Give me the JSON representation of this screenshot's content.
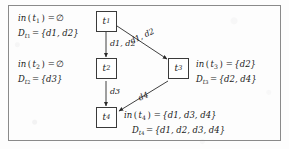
{
  "figure": {
    "type": "dataflow-graph",
    "border_color": "#8a8a8a",
    "node_border_color": "#3a3a3a",
    "edge_color": "#2a2a2a",
    "background": "#fdfdfd"
  },
  "nodes": [
    {
      "id": "t1",
      "base": "t",
      "sub": "1",
      "label": "t1"
    },
    {
      "id": "t2",
      "base": "t",
      "sub": "2",
      "label": "t2"
    },
    {
      "id": "t3",
      "base": "t",
      "sub": "3",
      "label": "t3"
    },
    {
      "id": "t4",
      "base": "t",
      "sub": "4",
      "label": "t4"
    }
  ],
  "edges": [
    {
      "from": "t1",
      "to": "t2",
      "label": "d1, d2"
    },
    {
      "from": "t1",
      "to": "t3",
      "label": "d1, d2"
    },
    {
      "from": "t2",
      "to": "t4",
      "label": "d3"
    },
    {
      "from": "t3",
      "to": "t4",
      "label": "d4"
    }
  ],
  "annotations": {
    "t1": {
      "in_fn": "in",
      "in_arg": "t",
      "in_arg_sub": "1",
      "in_value": "∅",
      "d_sym": "D",
      "d_sub": "t",
      "d_subsub": "1",
      "d_value": "{d1, d2}"
    },
    "t2": {
      "in_fn": "in",
      "in_arg": "t",
      "in_arg_sub": "2",
      "in_value": "∅",
      "d_sym": "D",
      "d_sub": "t",
      "d_subsub": "2",
      "d_value": "{d3}"
    },
    "t3": {
      "in_fn": "in",
      "in_arg": "t",
      "in_arg_sub": "3",
      "in_value": "{d2}",
      "d_sym": "D",
      "d_sub": "t",
      "d_subsub": "3",
      "d_value": "{d2, d4}"
    },
    "t4": {
      "in_fn": "in",
      "in_arg": "t",
      "in_arg_sub": "4",
      "in_value": "{d1, d3, d4}",
      "d_sym": "D",
      "d_sub": "t",
      "d_subsub": "4",
      "d_value": "{d1, d2, d3, d4}"
    }
  },
  "edge_labels": {
    "t1_t2": "d1, d2",
    "t1_t3": "d1, d2",
    "t2_t4": "d3",
    "t3_t4": "d4"
  },
  "symbols": {
    "equals": "=",
    "emptyset": "∅",
    "open_brace": "{",
    "close_brace": "}",
    "comma": ","
  }
}
